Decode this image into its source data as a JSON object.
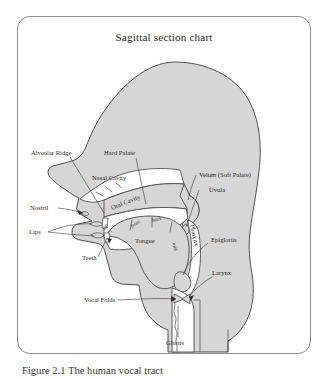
{
  "figure": {
    "title": "Sagittal section chart",
    "caption": "Figure 2.1 The human vocal tract",
    "colors": {
      "head_fill": "#d6d6d6",
      "cavity_fill": "#ffffff",
      "outline": "#4a4846",
      "border": "#8f8f8f",
      "text": "#2b2927",
      "page_background": "#ffffff"
    }
  },
  "labels": {
    "alveolar_ridge": "Alveolar Ridge",
    "hard_palate": "Hard Palate",
    "velum": "Velum (Soft Palate)",
    "uvula": "Uvula",
    "nasal_cavity": "Nasal Cavity",
    "nostril": "Nostril",
    "lips": "Lips",
    "teeth": "Teeth",
    "oral_cavity": "Oral Cavity",
    "tongue": "Tongue",
    "tongue_tip": "tip",
    "tongue_front": "front",
    "tongue_back": "back",
    "tongue_root": "root",
    "pharynx": "Pharynx",
    "epiglottis": "Epiglottis",
    "larynx": "Larynx",
    "vocal_folds": "Vocal Folds",
    "glottis": "Glottis"
  }
}
